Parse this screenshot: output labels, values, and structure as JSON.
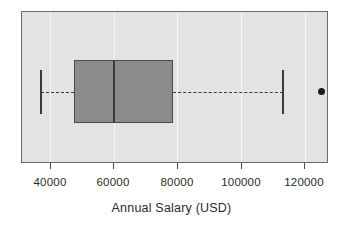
{
  "chart_data": {
    "type": "box",
    "title": "",
    "xlabel": "Annual Salary (USD)",
    "ylabel": "",
    "orientation": "horizontal",
    "xlim": [
      31000,
      127500
    ],
    "xticks": [
      40000,
      60000,
      80000,
      100000,
      120000
    ],
    "xticklabels": [
      "40000",
      "60000",
      "80000",
      "100000",
      "120000"
    ],
    "grid": true,
    "grid_axis": "x",
    "legend": null,
    "boxes": [
      {
        "label": "Annual Salary (USD)",
        "whisker_low": 36900,
        "q1": 47200,
        "median": 59800,
        "q3": 78400,
        "whisker_high": 113100,
        "outliers": [
          125000
        ],
        "box_fill": "#8c8c8c",
        "box_edge": "#4a4a4a",
        "median_color": "#3a3a3a",
        "whisker_style": "dashed",
        "outlier_marker": "filled-circle"
      }
    ],
    "colors": {
      "plot_background": "#e3e3e3",
      "figure_background": "#ffffff",
      "gridline": "#f6f6f6",
      "frame": "#6a6a6a",
      "text": "#2b2b2b"
    }
  },
  "axis": {
    "xlabel": "Annual Salary (USD)",
    "ticks": [
      {
        "value": 40000,
        "label": "40000"
      },
      {
        "value": 60000,
        "label": "60000"
      },
      {
        "value": 80000,
        "label": "80000"
      },
      {
        "value": 100000,
        "label": "100000"
      },
      {
        "value": 120000,
        "label": "120000"
      }
    ]
  }
}
